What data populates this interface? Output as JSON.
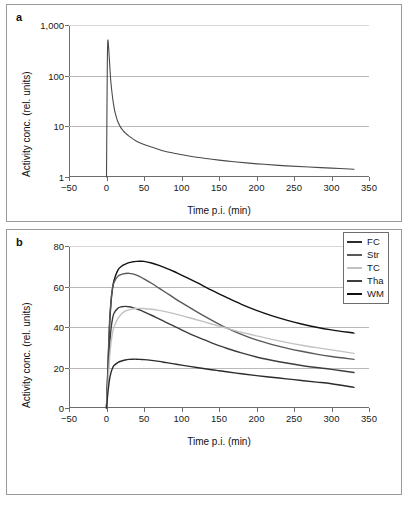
{
  "figure": {
    "panel_a_letter": "a",
    "panel_b_letter": "b"
  },
  "panel_a": {
    "ylabel": "Activity conc. (rel. units)",
    "xlabel": "Time p.i. (min)",
    "yticks": [
      "1",
      "10",
      "100",
      "1,000"
    ],
    "xticks": [
      "−50",
      "0",
      "50",
      "100",
      "150",
      "200",
      "250",
      "300",
      "350"
    ]
  },
  "panel_b": {
    "ylabel": "Activity conc. (rel. units)",
    "xlabel": "Time p.i. (min)",
    "yticks": [
      "0",
      "20",
      "40",
      "60",
      "80"
    ],
    "xticks": [
      "−50",
      "0",
      "50",
      "100",
      "150",
      "200",
      "250",
      "300",
      "350"
    ],
    "legend": [
      {
        "label": "FC",
        "color": "#2b2b2b"
      },
      {
        "label": "Str",
        "color": "#585858"
      },
      {
        "label": "TC",
        "color": "#c2c2c2"
      },
      {
        "label": "Tha",
        "color": "#3d3d3d"
      },
      {
        "label": "WM",
        "color": "#111111"
      }
    ]
  },
  "chart_data": [
    {
      "type": "line",
      "panel": "a",
      "title": "",
      "xlabel": "Time p.i. (min)",
      "ylabel": "Activity conc. (rel. units)",
      "yscale": "log",
      "xlim": [
        -50,
        350
      ],
      "ylim": [
        1,
        1000
      ],
      "xticks": [
        -50,
        0,
        50,
        100,
        150,
        200,
        250,
        300,
        350
      ],
      "yticks": [
        1,
        10,
        100,
        1000
      ],
      "grid": true,
      "legend": "none",
      "series": [
        {
          "name": "Arterial plasma input function",
          "color": "#4a4a4a",
          "x": [
            0,
            1,
            1.5,
            2,
            3,
            4,
            5,
            6,
            8,
            10,
            12,
            15,
            20,
            25,
            30,
            40,
            50,
            60,
            75,
            90,
            110,
            130,
            150,
            170,
            190,
            210,
            240,
            270,
            300,
            330
          ],
          "y": [
            1.0,
            120,
            400,
            500,
            330,
            190,
            110,
            70,
            38,
            24,
            17.5,
            12.5,
            9.0,
            7.4,
            6.4,
            5.1,
            4.4,
            3.9,
            3.3,
            2.95,
            2.6,
            2.35,
            2.15,
            2.0,
            1.88,
            1.78,
            1.66,
            1.57,
            1.5,
            1.42
          ]
        }
      ]
    },
    {
      "type": "line",
      "panel": "b",
      "title": "",
      "xlabel": "Time p.i. (min)",
      "ylabel": "Activity conc. (rel. units)",
      "yscale": "linear",
      "xlim": [
        -50,
        350
      ],
      "ylim": [
        0,
        80
      ],
      "xticks": [
        -50,
        0,
        50,
        100,
        150,
        200,
        250,
        300,
        350
      ],
      "yticks": [
        0,
        20,
        40,
        60,
        80
      ],
      "grid": true,
      "legend": "top-right",
      "x": [
        0,
        2,
        4,
        6,
        8,
        10,
        15,
        20,
        25,
        30,
        35,
        40,
        45,
        50,
        60,
        70,
        80,
        90,
        100,
        120,
        140,
        150,
        160,
        180,
        200,
        220,
        240,
        260,
        280,
        300,
        330
      ],
      "series": [
        {
          "name": "WM",
          "color": "#111111",
          "y": [
            0,
            20,
            40,
            52,
            59,
            63,
            68,
            70,
            71,
            71.8,
            72.2,
            72.4,
            72.5,
            72.4,
            71.6,
            70.4,
            69.0,
            67.4,
            65.6,
            62.0,
            58.2,
            56.4,
            54.6,
            51.2,
            48.2,
            45.6,
            43.4,
            41.5,
            39.9,
            38.6,
            37.0
          ]
        },
        {
          "name": "Str",
          "color": "#585858",
          "y": [
            0,
            22,
            42,
            53,
            59,
            62,
            65,
            66,
            66.4,
            66.5,
            66.2,
            65.6,
            64.8,
            63.8,
            61.6,
            59.2,
            56.8,
            54.4,
            52.0,
            47.6,
            43.4,
            41.4,
            39.6,
            36.4,
            33.6,
            31.4,
            29.6,
            28.0,
            26.6,
            25.4,
            24.0
          ]
        },
        {
          "name": "Tha",
          "color": "#3d3d3d",
          "y": [
            0,
            16,
            30,
            39,
            44,
            46.8,
            49.2,
            50.0,
            50.2,
            50.0,
            49.6,
            49.0,
            48.3,
            47.5,
            45.8,
            44.0,
            42.2,
            40.4,
            38.6,
            35.2,
            32.2,
            30.8,
            29.5,
            27.2,
            25.2,
            23.6,
            22.2,
            21.0,
            20.0,
            19.1,
            17.5
          ]
        },
        {
          "name": "TC",
          "color": "#c2c2c2",
          "y": [
            0,
            12,
            24,
            32,
            37,
            40,
            44,
            46.4,
            47.8,
            48.5,
            48.9,
            49.1,
            49.2,
            49.1,
            48.8,
            48.2,
            47.5,
            46.6,
            45.6,
            43.6,
            41.5,
            40.4,
            39.4,
            37.4,
            35.6,
            33.9,
            32.4,
            31.0,
            29.8,
            28.7,
            27.0
          ]
        },
        {
          "name": "FC",
          "color": "#2b2b2b",
          "y": [
            0,
            8,
            14,
            17.5,
            19.6,
            21.0,
            22.4,
            23.2,
            23.7,
            24.0,
            24.1,
            24.1,
            24.0,
            23.9,
            23.5,
            23.0,
            22.4,
            21.8,
            21.2,
            20.0,
            18.9,
            18.4,
            17.9,
            16.9,
            16.0,
            15.2,
            14.4,
            13.6,
            12.8,
            12.0,
            10.2
          ]
        }
      ]
    }
  ]
}
